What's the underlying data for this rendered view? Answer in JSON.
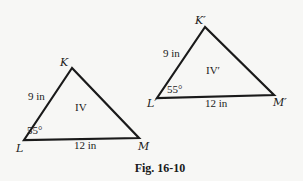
{
  "figure": {
    "caption": "Fig. 16-10",
    "caption_pos": [
      160,
      172
    ],
    "triangles": [
      {
        "id": "IV",
        "roman_label": "IV",
        "roman_pos": [
          75,
          111
        ],
        "vertices": {
          "K": {
            "label": "K",
            "pt": [
              72,
              68
            ],
            "label_pos": [
              60,
              66
            ]
          },
          "L": {
            "label": "L",
            "pt": [
              24,
              140
            ],
            "label_pos": [
              16,
              152
            ]
          },
          "M": {
            "label": "M",
            "pt": [
              139,
              138
            ],
            "label_pos": [
              138,
              150
            ]
          }
        },
        "side_KL": {
          "text": "9 in",
          "pos": [
            28,
            100
          ]
        },
        "side_LM": {
          "text": "12 in",
          "pos": [
            74,
            149
          ]
        },
        "angle_L": {
          "text": "55°",
          "pos": [
            27,
            134
          ]
        }
      },
      {
        "id": "IV-prime",
        "roman_label": "IV′",
        "roman_pos": [
          206,
          74
        ],
        "vertices": {
          "K": {
            "label": "K′",
            "pt": [
              205,
              27
            ],
            "label_pos": [
              195,
              24
            ]
          },
          "L": {
            "label": "L′",
            "pt": [
              157,
              98
            ],
            "label_pos": [
              147,
              107
            ]
          },
          "M": {
            "label": "M′",
            "pt": [
              274,
              95
            ],
            "label_pos": [
              273,
              106
            ]
          }
        },
        "side_KL": {
          "text": "9 in",
          "pos": [
            163,
            57
          ]
        },
        "side_LM": {
          "text": "12 in",
          "pos": [
            205,
            107
          ]
        },
        "angle_L": {
          "text": "55°",
          "pos": [
            167,
            93
          ]
        }
      }
    ]
  }
}
